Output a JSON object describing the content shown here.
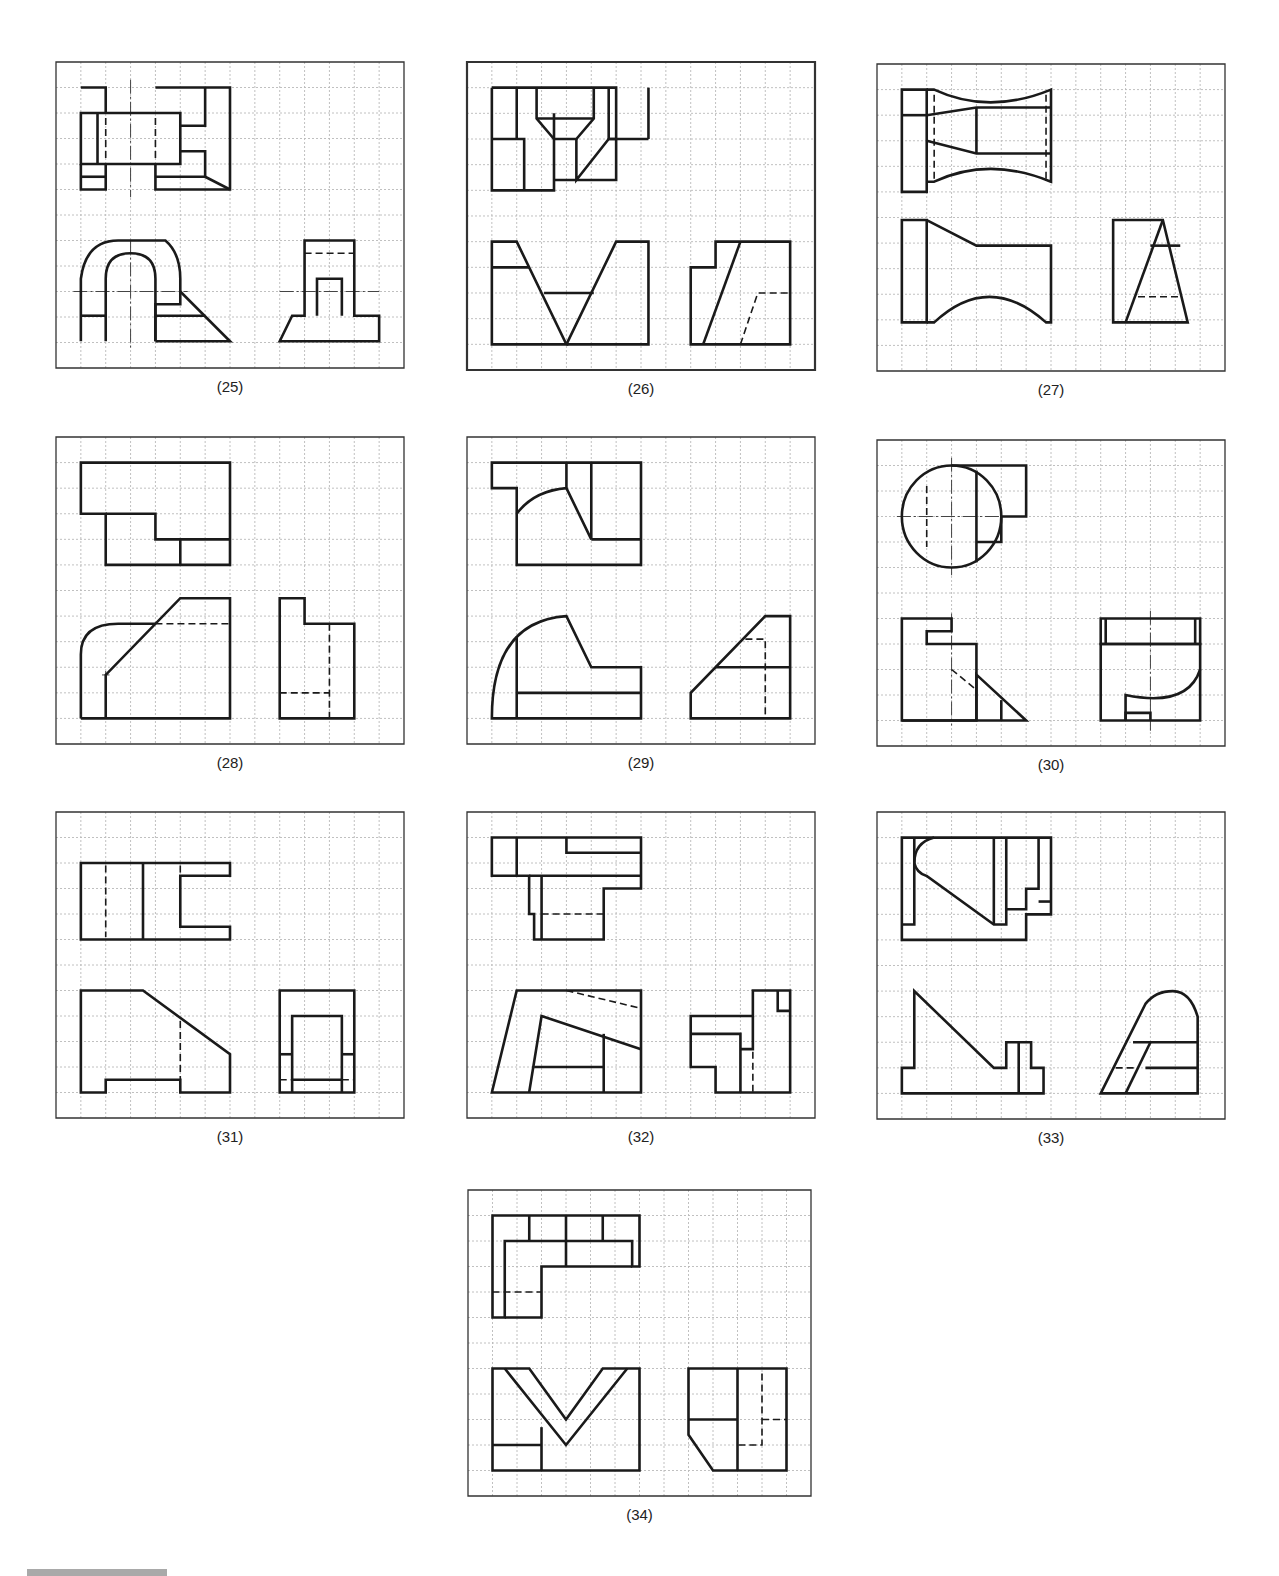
{
  "page": {
    "grid": {
      "cols": 14,
      "rows": 12,
      "cell_w": 24.8,
      "cell_h": 25.5,
      "grid_color": "#b9b9b9",
      "line_color": "#1a1a1a",
      "border_color": "#333333"
    }
  },
  "figures": [
    {
      "id": "25",
      "label": "(25)",
      "x": 56,
      "y": 62,
      "w": 348,
      "h": 306,
      "solid": [
        "M1 1 H2 V2",
        "M1 2 H5 V4 H1 Z",
        "M1.67 2 V4",
        "M1 4 V5 H2 V4",
        "M1 4.5 H2",
        "M4 1 H7 V5 H4 V4",
        "M6 1 V2.5 H5",
        "M5 3.5 H6 V4.5 H4",
        "M6 4.5 L7 5",
        "M1 10.95 V8.5 Q1.2 7 2.5 7 H4.4 Q5 7.5 5 8.5 V9.5 H4 V10.95",
        "M2 10.95 V8.5 Q2 7.5 3 7.5 Q4 7.5 4 8.5 V10.95",
        "M1 9.95 H2",
        "M4 9.95 H6",
        "M4 10.95 H7 L5 9",
        "M9 10.95 L9.5 9.95 H10 V7 H12 V9.95 H13 V10.95 Z",
        "M10.5 9.95 V8.5 H11.5 V9.95"
      ],
      "dashed": [
        "M2 2.2 V3.8",
        "M4 2.2 V3.8",
        "M10 7.5 H12"
      ],
      "center": [
        "M3 0.7 V5.3",
        "M3 7 V11.2",
        "M0.7 9 H5.3",
        "M9 9 H13"
      ]
    },
    {
      "id": "26",
      "label": "(26)",
      "x": 467,
      "y": 62,
      "w": 348,
      "h": 308,
      "solid": [
        "M1 1 H6 V4.6 H3.5",
        "M1 1 V5 H3.5 V2",
        "M2 1 V3",
        "M1 3 H2.3 V5",
        "M2.8 1 V2.2 L3.5 3 H4.4 L5.1 2.2 V1",
        "M2.8 2.2 H5.1",
        "M5.7 1 V3 H6",
        "M4.4 3 V4.6 L5.7 3 H7.3",
        "M7.3 1 V3",
        "M1 7 H2 L4 11 H1 Z",
        "M1 8 H2.5",
        "M3.1 9 H5.1",
        "M4 11 H7.3 V7 H6 L4 11",
        "M9 11 V8 H10 V7 H13 V11 Z",
        "M9.5 11 L11 7"
      ],
      "dashed": [
        "M11 11 L11.7 9 H13"
      ],
      "center": []
    },
    {
      "id": "27",
      "label": "(27)",
      "x": 877,
      "y": 64,
      "w": 348,
      "h": 307,
      "solid": [
        "M1 1 H2 V5 H1 Z",
        "M1 2 H2",
        "M2 1 H2.3 Q4.5 2 7 1 V4.6 Q4.5 3.6 2.3 4.6 H2",
        "M2 2 L4 1.7 H7",
        "M4 1.7 V3.5",
        "M2 3 L4 3.5 H7",
        "M1 6.1 H2 V10.1 H1 Z",
        "M2 6.1 L4 7.1 H7 V10.1 H6.8 Q4.5 8.1 2.3 10.1 H2",
        "M9.5 10.1 V6.1 H11.5 L12.5 10.1 Z",
        "M10 10.1 L11.5 6.1",
        "M11 7.1 H12.2"
      ],
      "dashed": [
        "M2.3 1.2 V4.5",
        "M6.8 1.2 V4.5",
        "M10.5 9.1 H12.2"
      ],
      "center": []
    },
    {
      "id": "28",
      "label": "(28)",
      "x": 56,
      "y": 437,
      "w": 348,
      "h": 307,
      "solid": [
        "M1 1 H7 V5 H2 V3 H1 Z",
        "M2 3 H4 V4 H7",
        "M5 4 V5",
        "M1 11 V8.5 Q1 7.3 2.5 7.3 H4",
        "M1 11 H7 V6.3 H5 L2 9.3 V11",
        "M9 11 V6.3 H10 V7.3 H12 V11 Z"
      ],
      "dashed": [
        "M4 7.3 H7",
        "M11 7.3 V11",
        "M9 10 H11"
      ],
      "center": [
        "M1.85 9.3 H2.15",
        "M2 9.15 V9.45"
      ]
    },
    {
      "id": "29",
      "label": "(29)",
      "x": 467,
      "y": 437,
      "w": 348,
      "h": 307,
      "solid": [
        "M1 1 H7 V5 H2 V2 H1 Z",
        "M2 3 Q2.7 2.1 4 2 V1",
        "M4 2 L5 4 V1",
        "M5 4 H7",
        "M1 11 Q1 7.2 4 7 L5 9 H7 V11 Z",
        "M2 7.8 V11",
        "M2 10 H7",
        "M9 11 V10 L12 7 H13 V11 Z",
        "M10 9 H13"
      ],
      "dashed": [
        "M11.2 7.9 H12 V11"
      ],
      "center": []
    },
    {
      "id": "30",
      "label": "(30)",
      "x": 877,
      "y": 440,
      "w": 348,
      "h": 306,
      "solid": [
        "M3 1 H6 V3 H5 V4 H4",
        "M1 3 A2 2 0 1 0 5 3 A2 2 0 1 0 1 3",
        "M4 1.2 V4.8",
        "M1 11 V7 H3 V7.5 H2 V8 H4 V11 Z",
        "M1 11 H6 L4 9.2 V11",
        "M5 10.2 V11",
        "M9 11 V8 H13 V11 Z",
        "M9 7 H13 V8 H9 Z",
        "M9.2 7 V8",
        "M12.8 7 V8",
        "M10 11 V10 Q12.5 10.5 13 9",
        "M10 11 V10.7 H11 V11"
      ],
      "dashed": [
        "M2 1.8 V4.2",
        "M3 9 L4 9.8"
      ],
      "center": [
        "M0.8 3 H5.2",
        "M3 0.7 V5.3",
        "M3 6.8 V11.2",
        "M11 6.7 V11.4"
      ]
    },
    {
      "id": "31",
      "label": "(31)",
      "x": 56,
      "y": 812,
      "w": 348,
      "h": 306,
      "solid": [
        "M1 2 H7 V2.5 H5 V4.5 H7 V5 H1 Z",
        "M3.5 2 V5",
        "M1 11 V7 H3.5 L7 9.5 V11 H5 V10.5 H2 V11 Z",
        "M9 11 V7 H12 V11 Z",
        "M9.5 11 V8 H11.5 V11",
        "M9 9.5 H9.5",
        "M11.5 9.5 H12",
        "M9.5 10.5 H11.5"
      ],
      "dashed": [
        "M2 2.1 V4.9",
        "M5 2.1 V2.5",
        "M5 8.2 V10.5",
        "M9 10.5 H9.5",
        "M11.5 10.5 H12"
      ],
      "center": []
    },
    {
      "id": "32",
      "label": "(32)",
      "x": 467,
      "y": 812,
      "w": 348,
      "h": 306,
      "solid": [
        "M1 1 H7 V3 H5.5 V5 H2.7 V4 H2.5 V2.5 H1 Z",
        "M2 1 V2.5",
        "M4 1 V1.6 H7",
        "M2.5 2.5 H7",
        "M3 2.5 V5",
        "M1 11 L2 7 H7 V11 Z",
        "M2.5 11 L3 8 L7 9.3",
        "M5.5 8.7 V11",
        "M2.7 10 H5.5",
        "M9 10 V8 H11.5 V7 H13 V11 H10 V10 Z",
        "M9 8.7 H11 V11",
        "M11 9.3 H11.5 V8",
        "M12.5 7 V7.8 H13"
      ],
      "dashed": [
        "M3 4 H5.5",
        "M4 7 L7 7.7",
        "M11.5 9.4 V11"
      ],
      "center": []
    },
    {
      "id": "33",
      "label": "(33)",
      "x": 877,
      "y": 812,
      "w": 348,
      "h": 307,
      "solid": [
        "M1 1 H7 V4 H6 V5 H1 Z",
        "M1.5 1 V4.4 H1",
        "M2.3 1 Q1.5 1.2 1.5 2 Q1.6 2.4 2 2.5 L4.7 4.4 H5.2 V1",
        "M4.7 1 V4.4",
        "M5.2 3.8 H6 V3 H6.5 V1",
        "M6.5 3.5 H7",
        "M1 11 V10 H1.5 V7 L4.7 10 H5.2 V9 H6.2 V10 H6.7 V11 Z",
        "M5.7 9 V11",
        "M9 11 L10.8 7.5 Q11.2 7 11.9 7 Q12.6 7 12.9 8 V11 Z",
        "M10.3 9 H12.9",
        "M10 11 L11 9",
        "M10.8 10 H12.9"
      ],
      "dashed": [
        "M9.6 10 H10.4"
      ],
      "center": []
    },
    {
      "id": "34",
      "label": "(34)",
      "x": 468,
      "y": 1190,
      "w": 343,
      "h": 306,
      "solid": [
        "M1 1 H7 V3 H6.7 V2 H1.5 V5 H1 Z",
        "M1.5 5 H3 V3 H6.7",
        "M2.5 1 V2",
        "M4 1 V3",
        "M5.5 1 V2",
        "M1 11 V7 H2.5 L4 9 L5.5 7 H7 V11 Z",
        "M1.5 7 L4 10 L6.5 7",
        "M3 9.3 V11",
        "M1 10 H3",
        "M9 9.6 V7 H13 V11 H10 Z",
        "M11 7 V11",
        "M9 9 H11"
      ],
      "dashed": [
        "M1 4 H3",
        "M12 7.2 V10 H11",
        "M12 9 H13"
      ],
      "center": []
    }
  ]
}
